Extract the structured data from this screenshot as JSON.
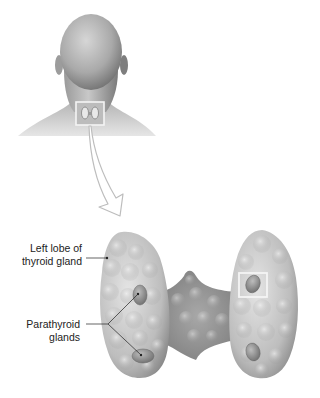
{
  "diagram": {
    "type": "anatomical-illustration",
    "labels": {
      "left_lobe": {
        "line1": "Left lobe of",
        "line2": "thyroid gland"
      },
      "parathyroid": {
        "line1": "Parathyroid",
        "line2": "glands"
      }
    },
    "parts": [
      "head-and-neck-posterior-view",
      "neck-location-highlight-box",
      "magnification-arrow",
      "thyroid-left-lobe",
      "thyroid-right-lobe",
      "thyroid-isthmus",
      "parathyroid-gland-upper-left",
      "parathyroid-gland-lower-left",
      "parathyroid-gland-upper-right-highlighted",
      "parathyroid-gland-lower-right"
    ],
    "colors": {
      "background": "#ffffff",
      "skin_light": "#d8d8d8",
      "skin_dark": "#8a8a8a",
      "gland_light": "#e2e2e2",
      "gland_mid": "#b4b4b4",
      "gland_dark": "#7e7e7e",
      "highlight_box": "#f4f4f4",
      "leader_line": "#222222"
    }
  }
}
